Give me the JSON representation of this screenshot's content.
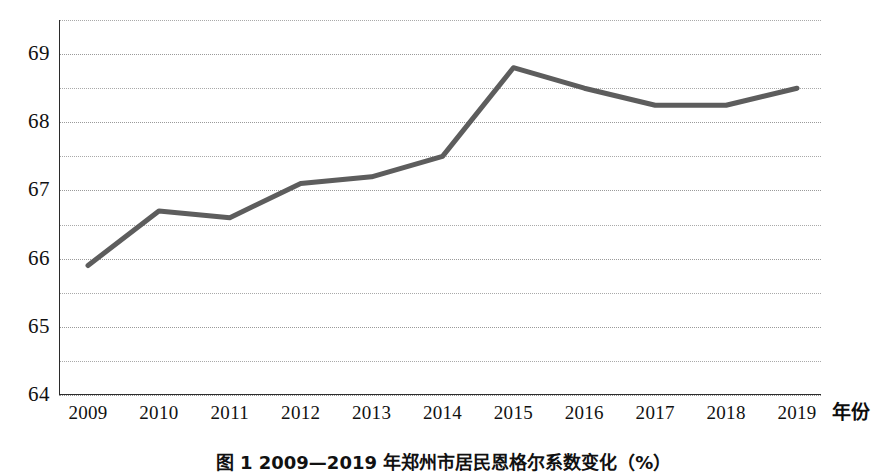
{
  "chart_data": {
    "type": "line",
    "title": "",
    "xlabel": "年份",
    "ylabel": "",
    "categories": [
      "2009",
      "2010",
      "2011",
      "2012",
      "2013",
      "2014",
      "2015",
      "2016",
      "2017",
      "2018",
      "2019"
    ],
    "values": [
      65.9,
      66.7,
      66.6,
      67.1,
      67.2,
      67.5,
      68.8,
      68.5,
      68.25,
      68.25,
      68.5
    ],
    "series": [
      {
        "name": "",
        "values": [
          65.9,
          66.7,
          66.6,
          67.1,
          67.2,
          67.5,
          68.8,
          68.5,
          68.25,
          68.25,
          68.5
        ]
      }
    ],
    "ylim": [
      64,
      69.5
    ],
    "xlim": [
      "2009",
      "2019"
    ],
    "y_major_ticks": [
      "69",
      "68",
      "67",
      "66",
      "65",
      "64"
    ],
    "y_major_values": [
      69,
      68,
      67,
      66,
      65,
      64
    ],
    "y_minor_values": [
      69.5,
      68.5,
      67.5,
      66.5,
      65.5,
      64.5
    ],
    "grid": "horizontal-dotted",
    "legend": "none",
    "line_color": "#5d5d5d",
    "grid_color": "#a9a9a9",
    "axis_color": "#2b2b2b",
    "markers": "none",
    "annotations": []
  },
  "axes": {
    "y_labels": [
      {
        "text": "69",
        "value": 69
      },
      {
        "text": "68",
        "value": 68
      },
      {
        "text": "67",
        "value": 67
      },
      {
        "text": "66",
        "value": 66
      },
      {
        "text": "65",
        "value": 65
      },
      {
        "text": "64",
        "value": 64
      }
    ],
    "x_labels": [
      {
        "text": "2009"
      },
      {
        "text": "2010"
      },
      {
        "text": "2011"
      },
      {
        "text": "2012"
      },
      {
        "text": "2013"
      },
      {
        "text": "2014"
      },
      {
        "text": "2015"
      },
      {
        "text": "2016"
      },
      {
        "text": "2017"
      },
      {
        "text": "2018"
      },
      {
        "text": "2019"
      }
    ],
    "x_axis_title": "年份"
  },
  "caption": {
    "text": "图 1  2009—2019 年郑州市居民恩格尔系数变化（%）"
  }
}
